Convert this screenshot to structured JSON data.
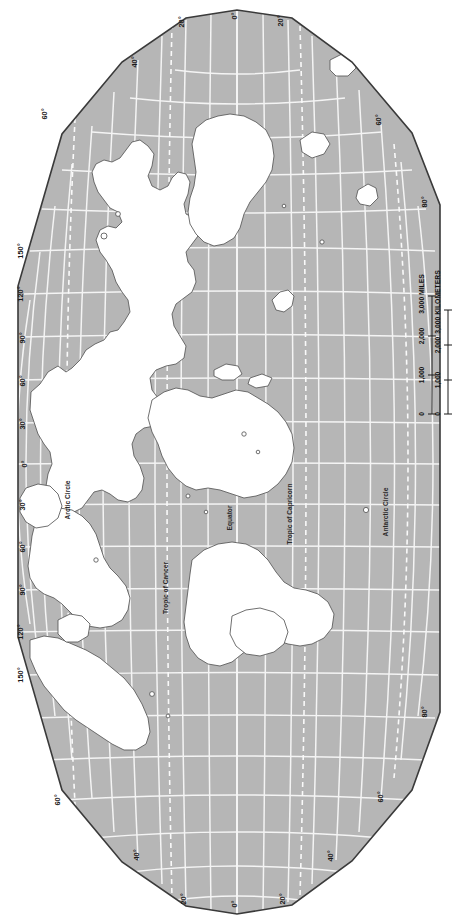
{
  "map": {
    "title": "World Map",
    "projection": "interrupted-oval",
    "orientation": "rotated-90-ccw",
    "colors": {
      "ocean": "#b6b6b6",
      "land": "#ffffff",
      "graticule": "#f2f2f2",
      "outline": "#3a3a3a",
      "coastline": "#4a4a4a",
      "label": "#1a1a1a",
      "background": "#ffffff"
    },
    "latitude_lines": [
      {
        "name": "arctic-circle",
        "label": "Arctic Circle"
      },
      {
        "name": "tropic-of-cancer",
        "label": "Tropic of Cancer"
      },
      {
        "name": "equator",
        "label": "Equator"
      },
      {
        "name": "tropic-of-capricorn",
        "label": "Tropic of Capricorn"
      },
      {
        "name": "antarctic-circle",
        "label": "Antarctic Circle"
      }
    ],
    "edge_labels": {
      "left": [
        "60°",
        "150°",
        "120°",
        "90°",
        "60°",
        "30°",
        "0°",
        "30°",
        "60°",
        "90°",
        "120°",
        "150°",
        "60°"
      ],
      "right": [
        "60°",
        "80°",
        "80°",
        "60°"
      ],
      "top": [
        "40°",
        "20°",
        "0°",
        "20°"
      ],
      "bottom": [
        "40°",
        "20°",
        "0°",
        "20°",
        "40°"
      ]
    },
    "longitude_labels_detail": [
      {
        "value": "60°",
        "x": 47,
        "y": 114
      },
      {
        "value": "40°",
        "x": 137,
        "y": 62
      },
      {
        "value": "20°",
        "x": 184,
        "y": 22
      },
      {
        "value": "0°",
        "x": 237,
        "y": 16
      },
      {
        "value": "20°",
        "x": 283,
        "y": 21
      },
      {
        "value": "60°",
        "x": 381,
        "y": 120
      },
      {
        "value": "80°",
        "x": 427,
        "y": 202
      },
      {
        "value": "150°",
        "x": 23,
        "y": 251
      },
      {
        "value": "120°",
        "x": 23,
        "y": 294
      },
      {
        "value": "90°",
        "x": 25,
        "y": 338
      },
      {
        "value": "60°",
        "x": 25,
        "y": 381
      },
      {
        "value": "30°",
        "x": 25,
        "y": 424
      },
      {
        "value": "0°",
        "x": 27,
        "y": 464
      },
      {
        "value": "30°",
        "x": 25,
        "y": 505
      },
      {
        "value": "60°",
        "x": 25,
        "y": 547
      },
      {
        "value": "90°",
        "x": 25,
        "y": 590
      },
      {
        "value": "120°",
        "x": 23,
        "y": 632
      },
      {
        "value": "150°",
        "x": 23,
        "y": 675
      },
      {
        "value": "60°",
        "x": 60,
        "y": 800
      },
      {
        "value": "80°",
        "x": 427,
        "y": 712
      },
      {
        "value": "60°",
        "x": 383,
        "y": 797
      },
      {
        "value": "40°",
        "x": 139,
        "y": 855
      },
      {
        "value": "20°",
        "x": 186,
        "y": 899
      },
      {
        "value": "0°",
        "x": 237,
        "y": 904
      },
      {
        "value": "20°",
        "x": 285,
        "y": 899
      },
      {
        "value": "40°",
        "x": 333,
        "y": 856
      }
    ],
    "scale_bar": {
      "name": "distance-scale",
      "miles": {
        "unit_label": "3,000 MILES",
        "ticks": [
          "0",
          "1,000",
          "2,000"
        ]
      },
      "kilometers": {
        "unit_label": "3,000 KILOMETERS",
        "ticks": [
          "0",
          "1,000",
          "2,000"
        ]
      }
    }
  }
}
